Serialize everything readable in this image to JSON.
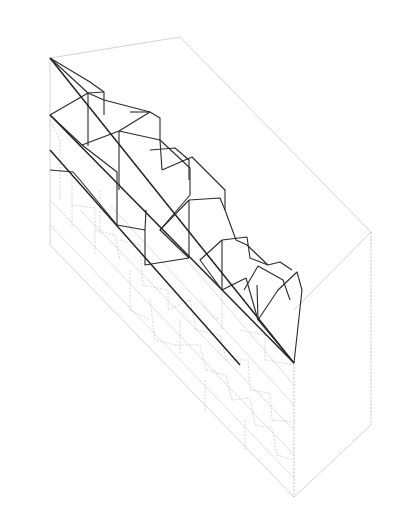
{
  "drawing": {
    "type": "axonometric section line drawing",
    "colors": {
      "background": "#ffffff",
      "solid_line": "#2a2a2a",
      "hidden_line": "#c4c4c4",
      "box_line": "#c8c8c8"
    },
    "bounding_box": {
      "lines": [
        [
          50,
          58,
          180,
          37
        ],
        [
          180,
          37,
          371,
          232
        ],
        [
          371,
          232,
          294,
          310
        ],
        [
          294,
          497,
          371,
          425
        ],
        [
          50,
          58,
          50,
          245
        ],
        [
          50,
          245,
          294,
          497
        ]
      ],
      "dashed": [
        [
          371,
          232,
          371,
          425
        ],
        [
          294,
          363,
          294,
          497
        ]
      ]
    },
    "main_diagonal": [
      [
        50,
        58,
        294,
        363
      ],
      [
        50,
        150,
        240,
        365
      ],
      [
        50,
        115,
        294,
        363
      ]
    ],
    "strata_lines": [
      [
        50,
        200,
        294,
        455
      ],
      [
        50,
        225,
        294,
        478
      ],
      [
        80,
        210,
        294,
        430
      ],
      [
        110,
        205,
        294,
        405
      ],
      [
        140,
        205,
        294,
        385
      ]
    ],
    "solid_polylines": [
      [
        [
          50,
          58
        ],
        [
          90,
          82
        ],
        [
          104,
          92
        ],
        [
          104,
          115
        ]
      ],
      [
        [
          50,
          58
        ],
        [
          88,
          93
        ],
        [
          104,
          92
        ]
      ],
      [
        [
          88,
          93
        ],
        [
          104,
          100
        ],
        [
          150,
          112
        ],
        [
          160,
          118
        ],
        [
          160,
          140
        ]
      ],
      [
        [
          50,
          115
        ],
        [
          82,
          145
        ],
        [
          117,
          172
        ],
        [
          117,
          225
        ]
      ],
      [
        [
          50,
          115
        ],
        [
          88,
          93
        ],
        [
          88,
          146
        ]
      ],
      [
        [
          82,
          145
        ],
        [
          119,
          131
        ],
        [
          150,
          112
        ]
      ],
      [
        [
          117,
          225
        ],
        [
          145,
          230
        ],
        [
          146,
          210
        ]
      ],
      [
        [
          119,
          131
        ],
        [
          160,
          140
        ],
        [
          162,
          170
        ]
      ],
      [
        [
          119,
          131
        ],
        [
          119,
          190
        ]
      ],
      [
        [
          50,
          170
        ],
        [
          73,
          172
        ],
        [
          80,
          180
        ],
        [
          117,
          225
        ]
      ],
      [
        [
          130,
          112
        ],
        [
          150,
          112
        ]
      ],
      [
        [
          160,
          140
        ],
        [
          190,
          168
        ],
        [
          190,
          195
        ],
        [
          160,
          230
        ]
      ],
      [
        [
          150,
          150
        ],
        [
          175,
          148
        ],
        [
          189,
          160
        ],
        [
          189,
          180
        ]
      ],
      [
        [
          162,
          170
        ],
        [
          192,
          157
        ],
        [
          225,
          190
        ],
        [
          225,
          210
        ]
      ],
      [
        [
          189,
          200
        ],
        [
          220,
          198
        ],
        [
          225,
          210
        ],
        [
          236,
          240
        ]
      ],
      [
        [
          189,
          200
        ],
        [
          189,
          258
        ]
      ],
      [
        [
          145,
          230
        ],
        [
          145,
          265
        ],
        [
          189,
          258
        ]
      ],
      [
        [
          189,
          200
        ],
        [
          160,
          230
        ],
        [
          189,
          258
        ]
      ],
      [
        [
          222,
          240
        ],
        [
          247,
          237
        ],
        [
          250,
          258
        ],
        [
          268,
          265
        ]
      ],
      [
        [
          222,
          240
        ],
        [
          200,
          260
        ],
        [
          222,
          290
        ],
        [
          246,
          278
        ]
      ],
      [
        [
          222,
          240
        ],
        [
          222,
          290
        ]
      ],
      [
        [
          244,
          290
        ],
        [
          258,
          266
        ],
        [
          283,
          280
        ],
        [
          290,
          300
        ]
      ],
      [
        [
          257,
          285
        ],
        [
          258,
          320
        ],
        [
          294,
          363
        ]
      ],
      [
        [
          258,
          320
        ],
        [
          278,
          290
        ],
        [
          297,
          272
        ],
        [
          302,
          290
        ],
        [
          294,
          363
        ]
      ],
      [
        [
          268,
          265
        ],
        [
          280,
          262
        ],
        [
          292,
          270
        ]
      ],
      [
        [
          236,
          240
        ],
        [
          247,
          245
        ],
        [
          268,
          265
        ]
      ],
      [
        [
          246,
          278
        ],
        [
          258,
          320
        ]
      ]
    ],
    "hidden_polylines": [
      [
        [
          50,
          120
        ],
        [
          60,
          140
        ],
        [
          60,
          200
        ]
      ],
      [
        [
          72,
          178
        ],
        [
          72,
          228
        ]
      ],
      [
        [
          72,
          205
        ],
        [
          95,
          208
        ]
      ],
      [
        [
          95,
          210
        ],
        [
          95,
          255
        ]
      ],
      [
        [
          95,
          230
        ],
        [
          115,
          235
        ],
        [
          120,
          260
        ]
      ],
      [
        [
          100,
          190
        ],
        [
          100,
          235
        ]
      ],
      [
        [
          120,
          240
        ],
        [
          140,
          245
        ],
        [
          143,
          285
        ]
      ],
      [
        [
          143,
          285
        ],
        [
          168,
          290
        ],
        [
          168,
          310
        ]
      ],
      [
        [
          130,
          270
        ],
        [
          130,
          310
        ],
        [
          150,
          320
        ]
      ],
      [
        [
          150,
          300
        ],
        [
          155,
          340
        ],
        [
          175,
          345
        ]
      ],
      [
        [
          168,
          310
        ],
        [
          190,
          300
        ],
        [
          196,
          330
        ]
      ],
      [
        [
          175,
          345
        ],
        [
          200,
          345
        ],
        [
          206,
          370
        ]
      ],
      [
        [
          196,
          330
        ],
        [
          220,
          335
        ],
        [
          226,
          360
        ]
      ],
      [
        [
          206,
          370
        ],
        [
          226,
          375
        ],
        [
          232,
          400
        ]
      ],
      [
        [
          226,
          360
        ],
        [
          248,
          360
        ],
        [
          250,
          390
        ]
      ],
      [
        [
          232,
          400
        ],
        [
          250,
          398
        ],
        [
          255,
          425
        ]
      ],
      [
        [
          250,
          390
        ],
        [
          270,
          393
        ],
        [
          272,
          420
        ]
      ],
      [
        [
          255,
          425
        ],
        [
          272,
          428
        ],
        [
          277,
          455
        ]
      ],
      [
        [
          272,
          420
        ],
        [
          294,
          422
        ]
      ],
      [
        [
          200,
          300
        ],
        [
          215,
          318
        ],
        [
          220,
          320
        ]
      ],
      [
        [
          240,
          330
        ],
        [
          265,
          335
        ],
        [
          265,
          360
        ]
      ],
      [
        [
          265,
          360
        ],
        [
          294,
          365
        ]
      ],
      [
        [
          277,
          455
        ],
        [
          294,
          460
        ]
      ],
      [
        [
          222,
          292
        ],
        [
          222,
          330
        ]
      ],
      [
        [
          180,
          320
        ],
        [
          180,
          355
        ]
      ],
      [
        [
          205,
          380
        ],
        [
          205,
          412
        ]
      ],
      [
        [
          245,
          420
        ],
        [
          245,
          450
        ]
      ]
    ]
  }
}
